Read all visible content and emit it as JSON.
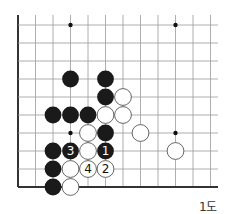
{
  "diagram": {
    "type": "go-board-corner",
    "caption": "1도",
    "grid": {
      "columns": 12,
      "rows": 10,
      "origin_x": 18,
      "origin_y": 25,
      "col_spacing": 17.5,
      "row_spacing": 18,
      "top_line_start_y": 15,
      "right_line_end_x": 218,
      "edges": [
        "left",
        "bottom"
      ]
    },
    "colors": {
      "line": "#9a9a9a",
      "edge": "#333333",
      "black_stone": "#1a1a1a",
      "white_stone": "#ffffff",
      "white_outline": "#555555"
    },
    "hoshi": [
      {
        "col": 3,
        "row": 0
      },
      {
        "col": 9,
        "row": 0
      },
      {
        "col": 3,
        "row": 6
      },
      {
        "col": 9,
        "row": 6
      }
    ],
    "stones": [
      {
        "color": "black",
        "col": 3,
        "row": 3,
        "label": ""
      },
      {
        "color": "black",
        "col": 5,
        "row": 3,
        "label": ""
      },
      {
        "color": "black",
        "col": 5,
        "row": 4,
        "label": ""
      },
      {
        "color": "black",
        "col": 2,
        "row": 5,
        "label": ""
      },
      {
        "color": "black",
        "col": 3,
        "row": 5,
        "label": ""
      },
      {
        "color": "black",
        "col": 4,
        "row": 5,
        "label": ""
      },
      {
        "color": "black",
        "col": 5,
        "row": 6,
        "label": ""
      },
      {
        "color": "black",
        "col": 2,
        "row": 7,
        "label": ""
      },
      {
        "color": "black",
        "col": 3,
        "row": 7,
        "label": "3"
      },
      {
        "color": "black",
        "col": 5,
        "row": 7,
        "label": "1"
      },
      {
        "color": "black",
        "col": 2,
        "row": 8,
        "label": ""
      },
      {
        "color": "black",
        "col": 2,
        "row": 9,
        "label": ""
      },
      {
        "color": "white",
        "col": 6,
        "row": 4,
        "label": ""
      },
      {
        "color": "white",
        "col": 5,
        "row": 5,
        "label": ""
      },
      {
        "color": "white",
        "col": 6,
        "row": 5,
        "label": ""
      },
      {
        "color": "white",
        "col": 4,
        "row": 6,
        "label": ""
      },
      {
        "color": "white",
        "col": 7,
        "row": 6,
        "label": ""
      },
      {
        "color": "white",
        "col": 4,
        "row": 7,
        "label": ""
      },
      {
        "color": "white",
        "col": 9,
        "row": 7,
        "label": ""
      },
      {
        "color": "white",
        "col": 3,
        "row": 8,
        "label": ""
      },
      {
        "color": "white",
        "col": 4,
        "row": 8,
        "label": "4"
      },
      {
        "color": "white",
        "col": 5,
        "row": 8,
        "label": "2"
      },
      {
        "color": "white",
        "col": 3,
        "row": 9,
        "label": ""
      }
    ]
  }
}
